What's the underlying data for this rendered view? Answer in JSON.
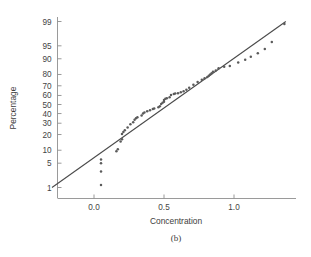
{
  "figure": {
    "caption": "(b)",
    "caption_letter": "b"
  },
  "chart_data": {
    "type": "scatter",
    "title": "",
    "subtitle": "",
    "xlabel": "Concentration",
    "ylabel": "Percentage",
    "xlim": [
      -0.32,
      1.48
    ],
    "ylim_percent": [
      0.6,
      99.6
    ],
    "grid": false,
    "legend": "none",
    "y_scale": "normal-probability",
    "x_ticks": [
      "0.0",
      "0.5",
      "1.0"
    ],
    "x_tick_values": [
      0.0,
      0.5,
      1.0
    ],
    "y_ticks": [
      "99",
      "95",
      "90",
      "80",
      "70",
      "60",
      "50",
      "40",
      "30",
      "20",
      "10",
      "5",
      "1"
    ],
    "y_tick_values": [
      99,
      95,
      90,
      80,
      70,
      60,
      50,
      40,
      30,
      20,
      10,
      5,
      1
    ],
    "reference_line": {
      "label": "fitted normal line",
      "x_start": -0.3,
      "y_start_percent": 1.0,
      "x_end": 1.37,
      "y_end_percent": 99.0
    },
    "series": [
      {
        "name": "Concentration order statistics",
        "marker": "dot",
        "color": "#5b5b5b",
        "x": [
          0.05,
          0.05,
          0.05,
          0.05,
          0.16,
          0.17,
          0.19,
          0.2,
          0.2,
          0.21,
          0.22,
          0.24,
          0.26,
          0.28,
          0.29,
          0.3,
          0.31,
          0.34,
          0.35,
          0.36,
          0.38,
          0.4,
          0.42,
          0.43,
          0.46,
          0.47,
          0.48,
          0.49,
          0.5,
          0.5,
          0.51,
          0.52,
          0.54,
          0.55,
          0.57,
          0.58,
          0.6,
          0.62,
          0.64,
          0.66,
          0.68,
          0.71,
          0.74,
          0.77,
          0.79,
          0.81,
          0.82,
          0.83,
          0.84,
          0.85,
          0.87,
          0.89,
          0.93,
          0.97,
          1.03,
          1.08,
          1.12,
          1.17,
          1.22,
          1.27,
          1.36
        ],
        "y_percent": [
          1.2,
          3.0,
          5.0,
          6.2,
          9.5,
          10.5,
          15.0,
          16.5,
          20.5,
          22.0,
          23.5,
          26.0,
          29.0,
          31.0,
          33.5,
          35.0,
          36.0,
          38.0,
          40.0,
          41.0,
          42.5,
          43.5,
          45.0,
          45.5,
          47.0,
          48.0,
          50.5,
          52.0,
          53.0,
          55.0,
          56.5,
          57.0,
          58.0,
          60.5,
          61.5,
          62.0,
          62.5,
          63.5,
          64.5,
          66.0,
          68.0,
          71.0,
          73.5,
          75.5,
          77.0,
          78.0,
          79.0,
          80.0,
          81.0,
          82.0,
          83.0,
          84.5,
          85.5,
          86.0,
          88.0,
          89.5,
          91.0,
          92.5,
          94.0,
          96.0,
          98.8
        ]
      }
    ]
  }
}
